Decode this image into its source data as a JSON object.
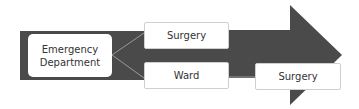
{
  "diagram": {
    "type": "patient-flow-arrow",
    "colors": {
      "arrow_fill": "#4a4a4a",
      "box_fill": "#ffffff",
      "box_border": "#cfcfcf",
      "connector_line": "#9a9a9a",
      "text": "#333333"
    },
    "nodes": {
      "emergency_department": {
        "line1": "Emergency",
        "line2": "Department"
      },
      "surgery_upper": {
        "label": "Surgery"
      },
      "ward": {
        "label": "Ward"
      },
      "surgery_lower": {
        "label": "Surgery"
      }
    },
    "edges": [
      {
        "from": "Emergency Department",
        "to": "Surgery"
      },
      {
        "from": "Emergency Department",
        "to": "Ward"
      },
      {
        "from": "Ward",
        "to": "Surgery"
      }
    ]
  }
}
